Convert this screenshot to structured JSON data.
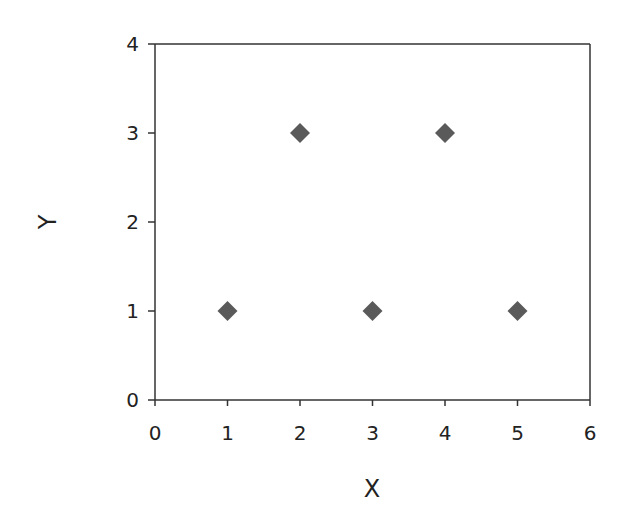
{
  "chart_data": {
    "type": "scatter",
    "title": "",
    "xlabel": "X",
    "ylabel": "Y",
    "xlim": [
      0,
      6
    ],
    "ylim": [
      0,
      4
    ],
    "xticks": [
      "0",
      "1",
      "2",
      "3",
      "4",
      "5",
      "6"
    ],
    "yticks": [
      "0",
      "1",
      "2",
      "3",
      "4"
    ],
    "grid": false,
    "legend": null,
    "marker": "diamond",
    "marker_color": "#5a5a5a",
    "series": [
      {
        "name": "data",
        "points": [
          [
            1,
            1
          ],
          [
            2,
            3
          ],
          [
            3,
            1
          ],
          [
            4,
            3
          ],
          [
            5,
            1
          ]
        ]
      }
    ]
  }
}
